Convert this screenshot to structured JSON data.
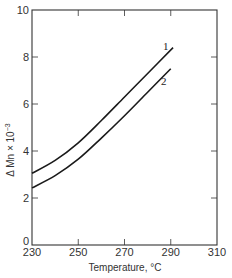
{
  "chart_data": {
    "type": "line",
    "title": "",
    "xlabel": "Temperature, °C",
    "ylabel": "Δ Mn × 10⁻³",
    "xlim": [
      230,
      310
    ],
    "ylim": [
      0,
      10
    ],
    "xticks": [
      230,
      250,
      270,
      290,
      310
    ],
    "yticks": [
      0,
      2,
      4,
      6,
      8,
      10
    ],
    "grid": false,
    "legend": "inline curve labels",
    "series": [
      {
        "name": "1",
        "x": [
          230,
          240,
          250,
          260,
          270,
          280,
          291
        ],
        "values": [
          3.05,
          3.6,
          4.35,
          5.3,
          6.3,
          7.3,
          8.4
        ]
      },
      {
        "name": "2",
        "x": [
          230,
          240,
          250,
          260,
          270,
          280,
          290
        ],
        "values": [
          2.43,
          2.95,
          3.65,
          4.55,
          5.5,
          6.5,
          7.5
        ]
      }
    ]
  },
  "labels": {
    "xlabel": "Temperature, °C",
    "ylabel": "Δ Mn × 10",
    "ylabel_exp": "−3",
    "curve1": "1",
    "curve2": "2"
  },
  "colors": {
    "line": "#1a1a1a",
    "axis": "#333333"
  }
}
